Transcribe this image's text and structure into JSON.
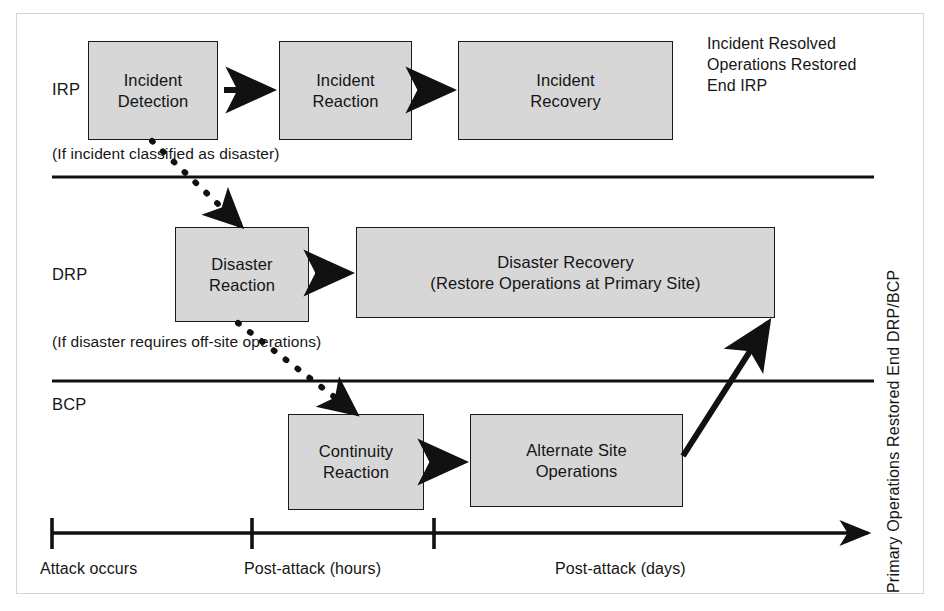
{
  "figure": {
    "colors": {
      "box_fill": "#d7d7d7",
      "box_stroke": "#1a1a1a",
      "text": "#161616",
      "frame": "#d4d4d4",
      "line": "#111111"
    }
  },
  "lanes": [
    {
      "label": "IRP"
    },
    {
      "label": "DRP"
    },
    {
      "label": "BCP"
    }
  ],
  "boxes": {
    "incident_detection": "Incident\nDetection",
    "incident_reaction": "Incident\nReaction",
    "incident_recovery": "Incident\nRecovery",
    "disaster_reaction": "Disaster\nReaction",
    "disaster_recovery": "Disaster Recovery\n(Restore Operations at Primary Site)",
    "continuity_reaction": "Continuity\nReaction",
    "alternate_site_operations": "Alternate Site\nOperations"
  },
  "conditions": {
    "incident_to_disaster": "(If incident classified as disaster)",
    "disaster_to_continuity": "(If disaster requires off-site operations)"
  },
  "notes": {
    "irp_end": "Incident Resolved\nOperations Restored\nEnd IRP",
    "drp_bcp_end": "Primary Operations Restored End DRP/BCP"
  },
  "timeline": {
    "ticks": [
      {
        "label": "Attack occurs"
      },
      {
        "label": "Post-attack (hours)"
      },
      {
        "label": "Post-attack (days)"
      }
    ]
  }
}
